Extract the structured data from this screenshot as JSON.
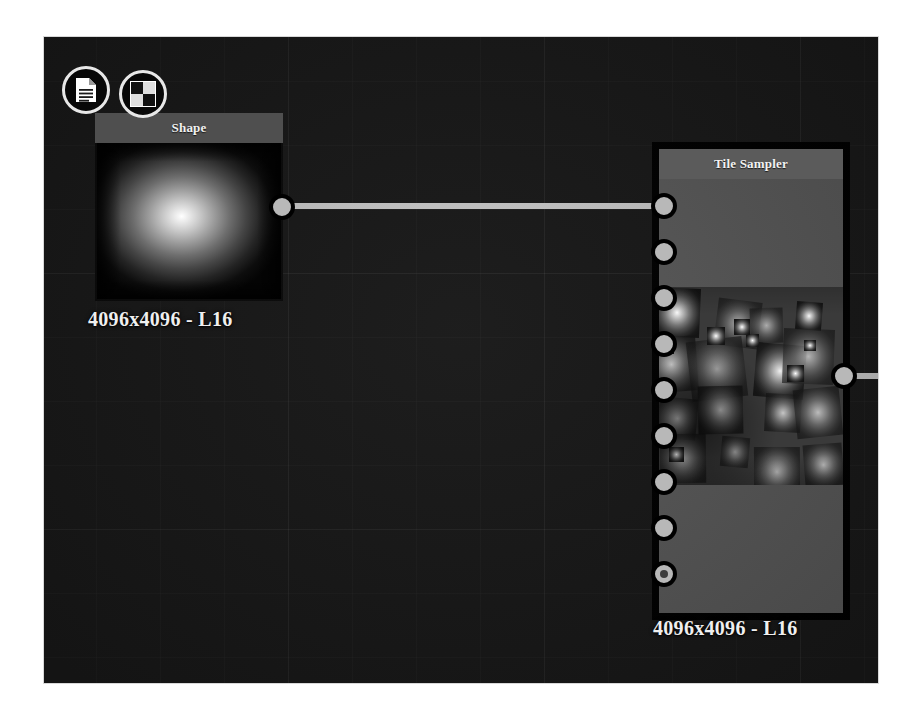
{
  "app": {
    "view": "node-graph-canvas",
    "background_color": "#191919",
    "grid": true
  },
  "badges": [
    {
      "name": "graph-document-icon",
      "icon": "document-icon",
      "tooltip": "Graph"
    },
    {
      "name": "checker-thumbnail-icon",
      "icon": "checkerboard-icon",
      "tooltip": "Thumbnail"
    }
  ],
  "nodes": [
    {
      "id": "shape",
      "title": "Shape",
      "caption": "4096x4096 - L16",
      "selected": false,
      "preview_type": "radial-glow",
      "inputs": [],
      "outputs": [
        {
          "name": "output",
          "type": "grayscale",
          "connected": true
        }
      ]
    },
    {
      "id": "tile_sampler",
      "title": "Tile Sampler",
      "caption": "4096x4096 - L16",
      "selected": true,
      "preview_type": "tiled-glow-pattern",
      "inputs": [
        {
          "name": "pattern-input",
          "type": "grayscale",
          "connected": true,
          "style": "solid"
        },
        {
          "name": "background-input",
          "type": "grayscale",
          "connected": false,
          "style": "solid"
        },
        {
          "name": "scale-map-input",
          "type": "grayscale",
          "connected": false,
          "style": "solid"
        },
        {
          "name": "displacement-map-input",
          "type": "grayscale",
          "connected": false,
          "style": "solid"
        },
        {
          "name": "rotation-map-input",
          "type": "grayscale",
          "connected": false,
          "style": "solid"
        },
        {
          "name": "vector-map-input",
          "type": "grayscale",
          "connected": false,
          "style": "solid"
        },
        {
          "name": "color-map-input",
          "type": "grayscale",
          "connected": false,
          "style": "solid"
        },
        {
          "name": "mask-map-input",
          "type": "grayscale",
          "connected": false,
          "style": "solid"
        },
        {
          "name": "pattern-distribution-map-input",
          "type": "grayscale",
          "connected": false,
          "style": "donut"
        }
      ],
      "outputs": [
        {
          "name": "output",
          "type": "grayscale",
          "connected": true
        }
      ]
    }
  ],
  "connections": [
    {
      "name": "shape-output-to-tile-sampler-pattern-input",
      "from_node": "shape",
      "from_port": "output",
      "to_node": "tile_sampler",
      "to_port": "pattern-input",
      "color": "#c9c9c9"
    },
    {
      "name": "tile-sampler-output-wire",
      "from_node": "tile_sampler",
      "from_port": "output",
      "to_node": "",
      "to_port": "",
      "color": "#c9c9c9"
    }
  ],
  "colors": {
    "canvas": "#191919",
    "node_header": "#5b5b5b",
    "node_body": "#5a5a5a",
    "selection_border": "#000000",
    "pin_fill": "#b8b8b8",
    "wire": "#c9c9c9",
    "caption_text": "#efefef"
  }
}
